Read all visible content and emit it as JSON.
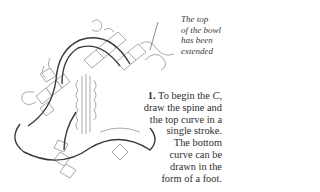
{
  "figure": {
    "annotation": {
      "lines": [
        "The top",
        "of the bowl",
        "has been",
        "extended"
      ]
    },
    "instruction": {
      "step_number": "1.",
      "lines": [
        "To begin the ",
        "C,",
        "draw the spine and",
        "the top curve in a",
        "single stroke.",
        "The bottom",
        "curve can be",
        "drawn in the",
        "form of a foot."
      ]
    },
    "colors": {
      "ink_dark": "#3a3a3a",
      "ink_light": "#a8a8a8",
      "background": "#ffffff"
    }
  }
}
